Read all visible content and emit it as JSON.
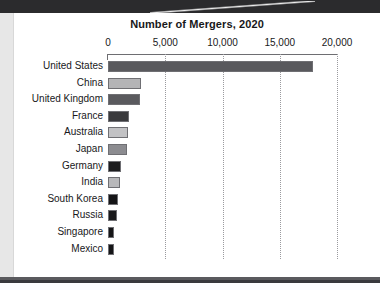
{
  "chart_data": {
    "type": "bar",
    "orientation": "horizontal",
    "title": "Number of Mergers, 2020",
    "xlabel": "",
    "ylabel": "",
    "xlim": [
      0,
      20000
    ],
    "xticks": [
      "0",
      "5,000",
      "10,000",
      "15,000",
      "20,000"
    ],
    "xtick_values": [
      0,
      5000,
      10000,
      15000,
      20000
    ],
    "grid": "vertical-dotted",
    "legend": "none",
    "categories": [
      "United States",
      "China",
      "United Kingdom",
      "France",
      "Australia",
      "Japan",
      "Germany",
      "India",
      "South Korea",
      "Russia",
      "Singapore",
      "Mexico"
    ],
    "values": [
      17900,
      2900,
      2800,
      1830,
      1750,
      1660,
      1130,
      1050,
      870,
      790,
      520,
      500
    ],
    "bar_colors": [
      "#59595d",
      "#b4b4b6",
      "#5a5a5e",
      "#3a3a3d",
      "#c2c2c4",
      "#8c8c90",
      "#1d1d1f",
      "#b8b8ba",
      "#151517",
      "#19191b",
      "#151517",
      "#151517"
    ]
  },
  "colors": {
    "band": "#2b2b2d",
    "gutter": "#e7e7e7",
    "page": "#ffffff",
    "axis": "#6e6e72",
    "grid": "#9a9a9e",
    "text": "#18181a"
  }
}
